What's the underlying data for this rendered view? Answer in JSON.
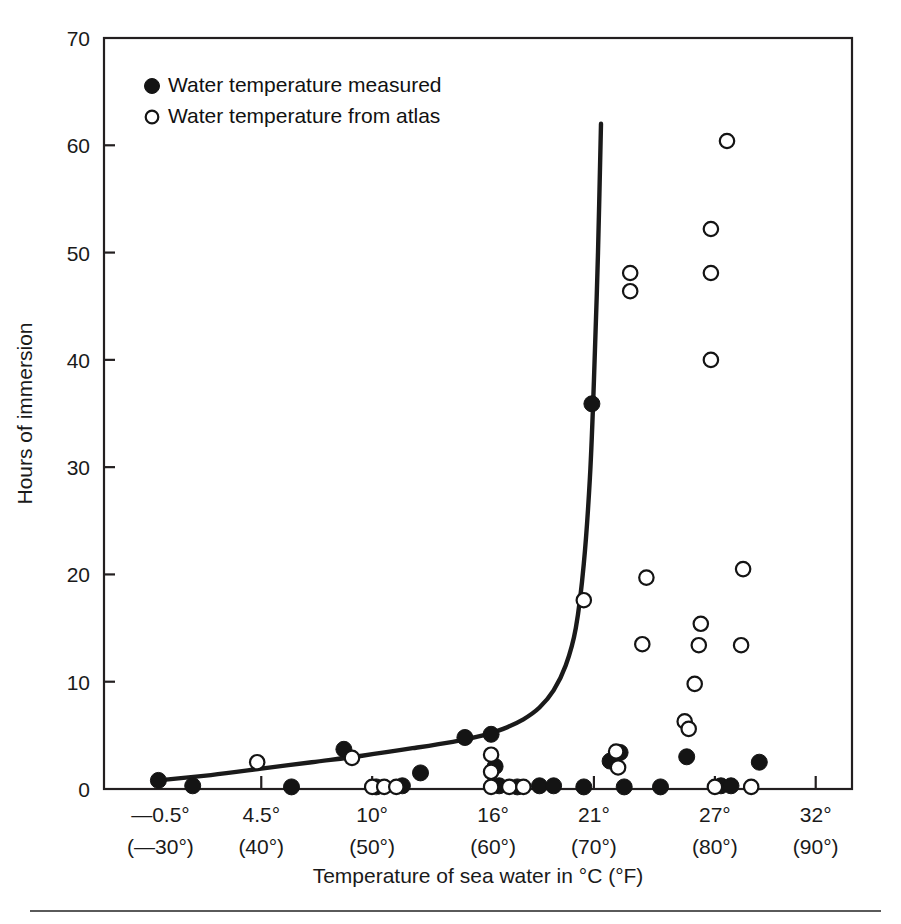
{
  "figure": {
    "background": "#ffffff",
    "ink_color": "#1a1a1a",
    "footer_rule": true
  },
  "axes": {
    "x_title": "Temperature of sea water in °C (°F)",
    "y_title": "Hours of immersion",
    "x_ticks": [
      {
        "value": -0.5,
        "celsius": "—0.5°",
        "fahrenheit": "(—30°)"
      },
      {
        "value": 4.5,
        "celsius": "4.5°",
        "fahrenheit": "(40°)"
      },
      {
        "value": 10,
        "celsius": "10°",
        "fahrenheit": "(50°)"
      },
      {
        "value": 16,
        "celsius": "16°",
        "fahrenheit": "(60°)"
      },
      {
        "value": 21,
        "celsius": "21°",
        "fahrenheit": "(70°)"
      },
      {
        "value": 27,
        "celsius": "27°",
        "fahrenheit": "(80°)"
      },
      {
        "value": 32,
        "celsius": "32°",
        "fahrenheit": "(90°)"
      }
    ],
    "y_ticks": [
      {
        "value": 0,
        "label": "0"
      },
      {
        "value": 10,
        "label": "10"
      },
      {
        "value": 20,
        "label": "20"
      },
      {
        "value": 30,
        "label": "30"
      },
      {
        "value": 40,
        "label": "40"
      },
      {
        "value": 50,
        "label": "50"
      },
      {
        "value": 60,
        "label": "60"
      },
      {
        "value": 70,
        "label": "70"
      }
    ]
  },
  "legend": {
    "entries": [
      {
        "marker": "filled-circle",
        "label": "Water temperature measured"
      },
      {
        "marker": "open-circle",
        "label": "Water temperature from atlas"
      }
    ]
  },
  "chart_data": {
    "type": "scatter",
    "title": "",
    "xlabel": "Temperature of sea water in °C (°F)",
    "ylabel": "Hours of immersion",
    "xlim": [
      -3.3,
      33.8
    ],
    "ylim": [
      0,
      70
    ],
    "grid": false,
    "legend_position": "top-left",
    "series": [
      {
        "name": "Water temperature measured",
        "marker": "filled-circle",
        "color": "#141414",
        "points": [
          [
            -0.6,
            0.8
          ],
          [
            1.1,
            0.3
          ],
          [
            6.0,
            0.2
          ],
          [
            8.6,
            3.7
          ],
          [
            10.2,
            0.2
          ],
          [
            11.5,
            0.3
          ],
          [
            12.4,
            1.5
          ],
          [
            14.6,
            4.8
          ],
          [
            15.9,
            5.1
          ],
          [
            16.1,
            2.1
          ],
          [
            16.3,
            0.3
          ],
          [
            17.2,
            0.2
          ],
          [
            18.3,
            0.3
          ],
          [
            19.0,
            0.3
          ],
          [
            20.5,
            0.2
          ],
          [
            20.9,
            35.9
          ],
          [
            21.8,
            2.6
          ],
          [
            22.3,
            3.4
          ],
          [
            22.5,
            0.2
          ],
          [
            24.3,
            0.2
          ],
          [
            25.6,
            3.0
          ],
          [
            27.3,
            0.3
          ],
          [
            27.8,
            0.3
          ],
          [
            29.2,
            2.5
          ]
        ]
      },
      {
        "name": "Water temperature from atlas",
        "marker": "open-circle",
        "color": "#ffffff",
        "points": [
          [
            4.3,
            2.5
          ],
          [
            9.0,
            2.9
          ],
          [
            10.0,
            0.2
          ],
          [
            10.6,
            0.2
          ],
          [
            11.2,
            0.2
          ],
          [
            15.9,
            3.2
          ],
          [
            15.9,
            1.6
          ],
          [
            15.9,
            0.2
          ],
          [
            16.8,
            0.2
          ],
          [
            17.5,
            0.2
          ],
          [
            20.5,
            17.6
          ],
          [
            22.1,
            3.5
          ],
          [
            22.2,
            2.0
          ],
          [
            22.8,
            48.1
          ],
          [
            22.8,
            46.4
          ],
          [
            23.4,
            13.5
          ],
          [
            23.6,
            19.7
          ],
          [
            25.5,
            6.3
          ],
          [
            25.7,
            5.6
          ],
          [
            26.0,
            9.8
          ],
          [
            26.2,
            13.4
          ],
          [
            26.3,
            15.4
          ],
          [
            26.8,
            40.0
          ],
          [
            26.8,
            48.1
          ],
          [
            26.8,
            52.2
          ],
          [
            27.0,
            0.2
          ],
          [
            27.6,
            60.4
          ],
          [
            28.3,
            13.4
          ],
          [
            28.4,
            20.5
          ],
          [
            28.8,
            0.2
          ]
        ]
      }
    ],
    "trend_curve": {
      "name": "survival-time curve",
      "points": [
        [
          -0.6,
          0.8
        ],
        [
          2.0,
          1.3
        ],
        [
          4.5,
          1.9
        ],
        [
          7.0,
          2.5
        ],
        [
          9.5,
          3.1
        ],
        [
          12.0,
          3.8
        ],
        [
          14.0,
          4.4
        ],
        [
          15.5,
          5.0
        ],
        [
          16.5,
          5.6
        ],
        [
          17.5,
          6.5
        ],
        [
          18.3,
          7.6
        ],
        [
          19.0,
          9.2
        ],
        [
          19.6,
          11.5
        ],
        [
          20.1,
          15.0
        ],
        [
          20.5,
          21.0
        ],
        [
          20.8,
          29.0
        ],
        [
          21.0,
          38.0
        ],
        [
          21.2,
          50.0
        ],
        [
          21.35,
          62.0
        ]
      ]
    }
  }
}
